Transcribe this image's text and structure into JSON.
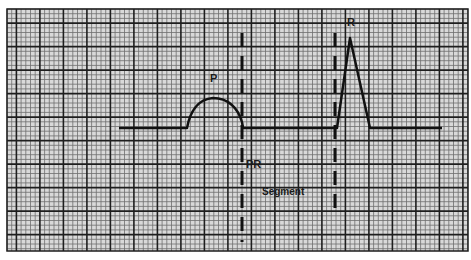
{
  "diagram": {
    "colors": {
      "paper": "#d9d9d9",
      "minor_grid": "#6e6e6e",
      "major_grid": "#1e1e1e",
      "trace": "#111111",
      "dashed_marker": "#111111"
    },
    "labels": {
      "p_wave": "P",
      "r_wave": "R",
      "pr": "PR",
      "segment": "Segment"
    },
    "waves": [
      "P wave",
      "PR segment",
      "QRS complex (R peak)"
    ]
  }
}
